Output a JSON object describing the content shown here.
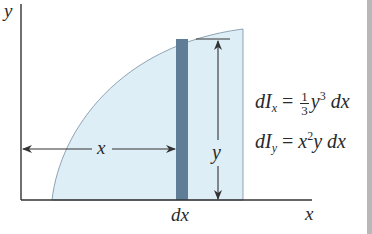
{
  "figure": {
    "axes": {
      "y_label": "y",
      "x_label": "x"
    },
    "dimensions": {
      "horizontal_label": "x",
      "vertical_label": "y",
      "strip_width_label": "dx"
    },
    "equations": {
      "dIx": {
        "lhs_d": "d",
        "lhs_I": "I",
        "lhs_sub": "x",
        "eq": " = ",
        "frac_num": "1",
        "frac_den": "3",
        "rhs_var": "y",
        "rhs_sup": "3",
        "rhs_tail": " dx",
        "full_text": "dI_x = (1/3) y^3 dx"
      },
      "dIy": {
        "lhs_d": "d",
        "lhs_I": "I",
        "lhs_sub": "y",
        "eq": " = ",
        "rhs_var": "x",
        "rhs_sup": "2",
        "rhs_tail": "y dx",
        "full_text": "dI_y = x^2 y dx"
      }
    },
    "colors": {
      "region_fill": "#deeef7",
      "region_outline": "#8ea3b3",
      "strip_fill": "#5f7d96",
      "axis": "#333333",
      "text": "#2a2a2a"
    }
  }
}
